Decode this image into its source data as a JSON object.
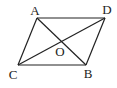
{
  "diagram": {
    "shape": "parallelogram",
    "points": {
      "A": {
        "label": "A",
        "x": 37,
        "y": 18,
        "lx": 35,
        "ly": 15
      },
      "D": {
        "label": "D",
        "x": 105,
        "y": 18,
        "lx": 107,
        "ly": 14
      },
      "C": {
        "label": "C",
        "x": 18,
        "y": 65,
        "lx": 13,
        "ly": 79
      },
      "B": {
        "label": "B",
        "x": 86,
        "y": 65,
        "lx": 88,
        "ly": 78
      },
      "O": {
        "label": "O",
        "x": 61,
        "y": 41,
        "lx": 60,
        "ly": 56
      }
    },
    "edges": [
      [
        "A",
        "D"
      ],
      [
        "D",
        "B"
      ],
      [
        "B",
        "C"
      ],
      [
        "C",
        "A"
      ]
    ],
    "diagonals": [
      [
        "A",
        "B"
      ],
      [
        "C",
        "D"
      ]
    ],
    "stroke_color": "#222222"
  }
}
